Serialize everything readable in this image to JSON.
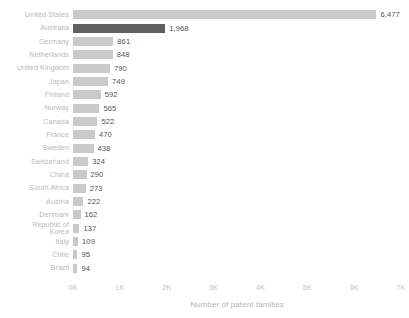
{
  "chart_data": {
    "type": "bar",
    "orientation": "horizontal",
    "title": "",
    "xlabel": "Number of patent families",
    "ylabel": "",
    "xlim": [
      0,
      7000
    ],
    "grid": false,
    "legend": null,
    "tick_labels": [
      "0K",
      "1K",
      "2K",
      "3K",
      "4K",
      "5K",
      "6K",
      "7K"
    ],
    "tick_values": [
      0,
      1000,
      2000,
      3000,
      4000,
      5000,
      6000,
      7000
    ],
    "highlight_category": "Australia",
    "colors": {
      "bar": "#c9c9c9",
      "bar_highlight": "#606060",
      "category_label": "#b9b9b9",
      "value_label": "#555555",
      "axis_text": "#c0c0c0",
      "background": "#ffffff"
    },
    "categories": [
      "United States",
      "Australia",
      "Germany",
      "Netherlands",
      "United Kingdom",
      "Japan",
      "Finland",
      "Norway",
      "Canada",
      "France",
      "Sweden",
      "Switzerland",
      "China",
      "South Africa",
      "Austria",
      "Denmark",
      "Republic of\nKorea",
      "Italy",
      "Chile",
      "Brazil"
    ],
    "values": [
      6477,
      1968,
      861,
      848,
      790,
      749,
      592,
      565,
      522,
      470,
      438,
      324,
      290,
      273,
      222,
      162,
      137,
      109,
      95,
      94
    ],
    "value_labels": [
      "6,477",
      "1,968",
      "861",
      "848",
      "790",
      "749",
      "592",
      "565",
      "522",
      "470",
      "438",
      "324",
      "290",
      "273",
      "222",
      "162",
      "137",
      "109",
      "95",
      "94"
    ]
  }
}
